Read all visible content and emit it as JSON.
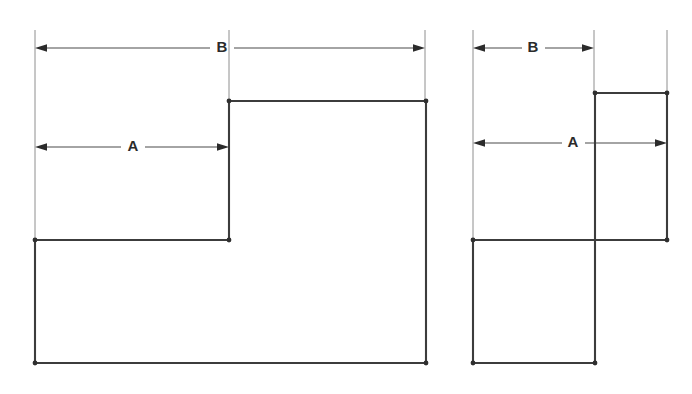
{
  "figure": {
    "background_color": "#ffffff",
    "outline_color": "#3c3c3c",
    "dimension_color": "#4a4a4a",
    "extension_color": "#8e8e8e",
    "label_color": "#2b2b2b",
    "views": [
      {
        "id": "left-view",
        "name": "wide-stepped-profile",
        "dimensions": [
          {
            "id": "left-b",
            "label": "B",
            "label_x": 222,
            "label_y": 48,
            "line_y": 48,
            "x_start": 35,
            "x_end": 425,
            "arrow_dir_start": "right",
            "arrow_dir_end": "left",
            "gap_left": 210,
            "gap_right": 234
          },
          {
            "id": "left-a",
            "label": "A",
            "label_x": 133,
            "label_y": 147,
            "line_y": 147,
            "x_start": 35,
            "x_end": 229,
            "arrow_dir_start": "right",
            "arrow_dir_end": "left",
            "gap_left": 121,
            "gap_right": 145
          }
        ],
        "extension_lines": [
          {
            "id": "left-ext-outer",
            "x": 35,
            "y_top": 30,
            "y_bottom": 242
          },
          {
            "id": "left-ext-step",
            "x": 229,
            "y_top": 30,
            "y_bottom": 101
          },
          {
            "id": "left-ext-right",
            "x": 425,
            "y_top": 30,
            "y_bottom": 103
          }
        ],
        "outline_points": "35,240 229,240 229,101 426,101 426,363 35,363 35,240",
        "vertices": [
          {
            "x": 35,
            "y": 240
          },
          {
            "x": 229,
            "y": 240
          },
          {
            "x": 229,
            "y": 101
          },
          {
            "x": 426,
            "y": 101
          },
          {
            "x": 426,
            "y": 363
          },
          {
            "x": 35,
            "y": 363
          }
        ]
      },
      {
        "id": "right-view",
        "name": "narrow-stepped-profile",
        "dimensions": [
          {
            "id": "right-b",
            "label": "B",
            "label_x": 533,
            "label_y": 48,
            "line_y": 48,
            "x_start": 473,
            "x_end": 594,
            "arrow_dir_start": "right",
            "arrow_dir_end": "left",
            "gap_left": 522,
            "gap_right": 545
          },
          {
            "id": "right-a",
            "label": "A",
            "label_x": 573,
            "label_y": 143,
            "line_y": 143,
            "x_start": 473,
            "x_end": 667,
            "arrow_dir_start": "right",
            "arrow_dir_end": "left",
            "gap_left": 562,
            "gap_right": 585
          }
        ],
        "extension_lines": [
          {
            "id": "right-ext-outer",
            "x": 473,
            "y_top": 30,
            "y_bottom": 242
          },
          {
            "id": "right-ext-step",
            "x": 594,
            "y_top": 30,
            "y_bottom": 93
          },
          {
            "id": "right-ext-right",
            "x": 667,
            "y_top": 30,
            "y_bottom": 95
          }
        ],
        "outline_points": "473,240 667,240 667,93 595,93 595,363 473,363 473,240",
        "vertices": [
          {
            "x": 473,
            "y": 240
          },
          {
            "x": 667,
            "y": 240
          },
          {
            "x": 667,
            "y": 93
          },
          {
            "x": 595,
            "y": 93
          },
          {
            "x": 595,
            "y": 363
          },
          {
            "x": 473,
            "y": 363
          }
        ]
      }
    ]
  }
}
